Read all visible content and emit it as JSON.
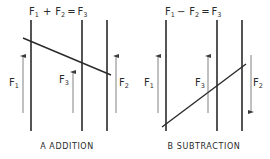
{
  "colors": {
    "ink": "#2a2a2a",
    "thin": "#4a4a4a",
    "background": "#ffffff"
  },
  "panels": [
    {
      "id": "addition",
      "equation": {
        "f1": "F",
        "s1": "1",
        "op": "+",
        "f2": "F",
        "s2": "2",
        "eq": "=",
        "f3": "F",
        "s3": "3"
      },
      "caption": "A  ADDITION",
      "forces": [
        {
          "name": "F",
          "sub": "1",
          "direction": "up"
        },
        {
          "name": "F",
          "sub": "3",
          "direction": "up"
        },
        {
          "name": "F",
          "sub": "2",
          "direction": "up"
        }
      ]
    },
    {
      "id": "subtraction",
      "equation": {
        "f1": "F",
        "s1": "1",
        "op": "−",
        "f2": "F",
        "s2": "2",
        "eq": "=",
        "f3": "F",
        "s3": "3"
      },
      "caption": "B  SUBTRACTION",
      "forces": [
        {
          "name": "F",
          "sub": "1",
          "direction": "up"
        },
        {
          "name": "F",
          "sub": "3",
          "direction": "up"
        },
        {
          "name": "F",
          "sub": "2",
          "direction": "down"
        }
      ]
    }
  ]
}
